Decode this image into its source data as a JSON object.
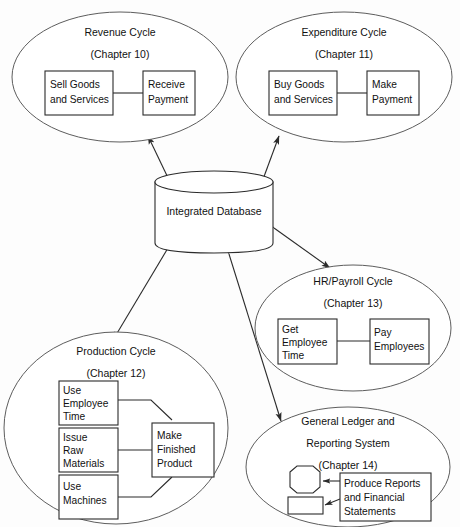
{
  "diagram": {
    "background_color": "#fdfdfd",
    "line_color": "#2b2b2b",
    "ellipse_color": "#5d5d5d",
    "center": {
      "label": "Integrated Database",
      "shape": "cylinder"
    },
    "cycles": [
      {
        "id": "revenue",
        "title": "Revenue Cycle",
        "chapter": "(Chapter 10)",
        "boxes": [
          {
            "id": "sell-goods",
            "lines": [
              "Sell Goods",
              "and Services"
            ]
          },
          {
            "id": "receive-payment",
            "lines": [
              "Receive",
              "Payment"
            ]
          }
        ]
      },
      {
        "id": "expenditure",
        "title": "Expenditure Cycle",
        "chapter": "(Chapter 11)",
        "boxes": [
          {
            "id": "buy-goods",
            "lines": [
              "Buy Goods",
              "and Services"
            ]
          },
          {
            "id": "make-payment",
            "lines": [
              "Make",
              "Payment"
            ]
          }
        ]
      },
      {
        "id": "hr-payroll",
        "title": "HR/Payroll Cycle",
        "chapter": "(Chapter 13)",
        "boxes": [
          {
            "id": "get-employee-time",
            "lines": [
              "Get",
              "Employee",
              "Time"
            ]
          },
          {
            "id": "pay-employees",
            "lines": [
              "Pay",
              "Employees"
            ]
          }
        ]
      },
      {
        "id": "production",
        "title": "Production Cycle",
        "chapter": "(Chapter 12)",
        "boxes": [
          {
            "id": "use-employee-time",
            "lines": [
              "Use",
              "Employee",
              "Time"
            ]
          },
          {
            "id": "issue-raw-materials",
            "lines": [
              "Issue",
              "Raw",
              "Materials"
            ]
          },
          {
            "id": "use-machines",
            "lines": [
              "Use",
              "Machines"
            ]
          },
          {
            "id": "make-finished-product",
            "lines": [
              "Make",
              "Finished",
              "Product"
            ]
          }
        ]
      },
      {
        "id": "general-ledger",
        "title_line1": "General Ledger and",
        "title_line2": "Reporting System",
        "chapter": "(Chapter 14)",
        "boxes": [
          {
            "id": "produce-reports",
            "lines": [
              "Produce Reports",
              "and Financial",
              "Statements"
            ]
          }
        ]
      }
    ],
    "flows": [
      {
        "id": "db-revenue",
        "from": "Integrated Database",
        "to": "Revenue Cycle",
        "direction": "bidirectional"
      },
      {
        "id": "db-expenditure",
        "from": "Integrated Database",
        "to": "Expenditure Cycle",
        "direction": "bidirectional"
      },
      {
        "id": "db-production",
        "from": "Integrated Database",
        "to": "Production Cycle",
        "direction": "bidirectional"
      },
      {
        "id": "db-hr-payroll",
        "from": "Integrated Database",
        "to": "HR/Payroll Cycle",
        "direction": "bidirectional"
      },
      {
        "id": "db-general-ledger",
        "from": "Integrated Database",
        "to": "General Ledger and Reporting System",
        "direction": "bidirectional"
      }
    ]
  },
  "labels": {
    "revenue_title": "Revenue Cycle",
    "revenue_chapter": "(Chapter 10)",
    "revenue_box1_l1": "Sell Goods",
    "revenue_box1_l2": "and Services",
    "revenue_box2_l1": "Receive",
    "revenue_box2_l2": "Payment",
    "expenditure_title": "Expenditure Cycle",
    "expenditure_chapter": "(Chapter 11)",
    "expenditure_box1_l1": "Buy Goods",
    "expenditure_box1_l2": "and Services",
    "expenditure_box2_l1": "Make",
    "expenditure_box2_l2": "Payment",
    "database_label": "Integrated Database",
    "hr_title": "HR/Payroll Cycle",
    "hr_chapter": "(Chapter 13)",
    "hr_box1_l1": "Get",
    "hr_box1_l2": "Employee",
    "hr_box1_l3": "Time",
    "hr_box2_l1": "Pay",
    "hr_box2_l2": "Employees",
    "production_title": "Production Cycle",
    "production_chapter": "(Chapter 12)",
    "production_box1_l1": "Use",
    "production_box1_l2": "Employee",
    "production_box1_l3": "Time",
    "production_box2_l1": "Issue",
    "production_box2_l2": "Raw",
    "production_box2_l3": "Materials",
    "production_box3_l1": "Use",
    "production_box3_l2": "Machines",
    "production_box4_l1": "Make",
    "production_box4_l2": "Finished",
    "production_box4_l3": "Product",
    "gl_title_l1": "General Ledger and",
    "gl_title_l2": "Reporting System",
    "gl_chapter": "(Chapter 14)",
    "gl_box1_l1": "Produce Reports",
    "gl_box1_l2": "and Financial",
    "gl_box1_l3": "Statements"
  }
}
